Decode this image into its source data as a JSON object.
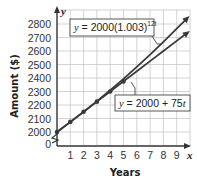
{
  "chart_data": {
    "type": "line",
    "title": "",
    "xlabel": "Years",
    "ylabel": "Amount ($)",
    "x_axis_var": "x",
    "y_axis_var": "y",
    "x_ticks": [
      "1",
      "2",
      "3",
      "4",
      "5",
      "6",
      "7",
      "8",
      "9"
    ],
    "y_ticks": [
      "0",
      "2000",
      "2100",
      "2200",
      "2300",
      "2400",
      "2500",
      "2600",
      "2700",
      "2800"
    ],
    "xlim": [
      0,
      10
    ],
    "ylim": [
      2000,
      2850
    ],
    "y_axis_break": true,
    "grid": true,
    "series": [
      {
        "name": "y = 2000(1.003)^12t",
        "label_base": "y = 2000(1.003)",
        "label_exp": "12t",
        "x": [
          0,
          1,
          2,
          3,
          4,
          5,
          6,
          7,
          8,
          9,
          9.8
        ],
        "values": [
          2000,
          2073,
          2149,
          2228,
          2310,
          2394,
          2482,
          2573,
          2667,
          2765,
          2843
        ]
      },
      {
        "name": "y = 2000 + 75t",
        "label": "y = 2000 + 75t",
        "x": [
          0,
          1,
          2,
          3,
          4,
          5,
          6,
          7,
          8,
          9,
          9.8
        ],
        "values": [
          2000,
          2075,
          2150,
          2225,
          2300,
          2375,
          2450,
          2525,
          2600,
          2675,
          2735
        ]
      }
    ],
    "markers": {
      "x": [
        0,
        1,
        2,
        3,
        4,
        5
      ],
      "values": [
        2000,
        2075,
        2150,
        2225,
        2300,
        2375
      ]
    },
    "legend_position": "callout labels on lines"
  },
  "colors": {
    "line": "#3a3a3a",
    "grid": "#c8c8c8",
    "axis": "#333333"
  }
}
